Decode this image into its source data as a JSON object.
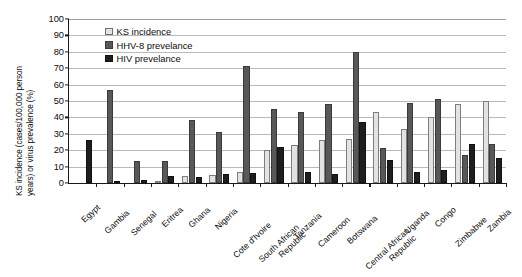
{
  "chart_data": {
    "type": "bar",
    "title": "",
    "xlabel": "",
    "ylabel_line1": "KS incidence (cases/100,000 person",
    "ylabel_line2": "years) or virus prevalence (%)",
    "ylim": [
      0,
      100
    ],
    "yticks": [
      0,
      10,
      20,
      30,
      40,
      50,
      60,
      70,
      80,
      90,
      100
    ],
    "grid": true,
    "legend_position": "top-left-inside",
    "categories": [
      "Egypt",
      "Gambia",
      "Senegal",
      "Eritrea",
      "Ghana",
      "Nigeria",
      "Cote d'Ivoire",
      "South African Republic",
      "Tanzania",
      "Cameroon",
      "Botswana",
      "Central African Republic",
      "Uganda",
      "Congo",
      "Zimbabwe",
      "Zambia"
    ],
    "category_lines": [
      [
        "Egypt"
      ],
      [
        "Gambia"
      ],
      [
        "Senegal"
      ],
      [
        "Eritrea"
      ],
      [
        "Ghana"
      ],
      [
        "Nigeria"
      ],
      [
        "Cote d'Ivoire"
      ],
      [
        "South African",
        "Republic"
      ],
      [
        "Tanzania"
      ],
      [
        "Cameroon"
      ],
      [
        "Botswana"
      ],
      [
        "Central African",
        "Republic"
      ],
      [
        "Uganda"
      ],
      [
        "Congo"
      ],
      [
        "Zimbabwe"
      ],
      [
        "Zambia"
      ]
    ],
    "series": [
      {
        "name": "KS incidence",
        "key": "ks",
        "color": "#e3e3e3",
        "values": [
          null,
          null,
          null,
          1.5,
          4.5,
          5,
          7,
          20,
          23,
          26,
          27,
          43,
          33,
          40,
          48,
          50
        ]
      },
      {
        "name": "HHV-8 prevelance",
        "key": "hhv",
        "color": "#585858",
        "values": [
          null,
          57,
          13.5,
          13.5,
          38.5,
          31,
          71.5,
          45,
          43,
          48,
          80,
          21.5,
          49,
          51,
          17,
          23.5
        ]
      },
      {
        "name": "HIV prevelance",
        "key": "hiv",
        "color": "#1e1e1e",
        "values": [
          26,
          1,
          2,
          4,
          3.5,
          5.5,
          6,
          22,
          7,
          5.5,
          37,
          14,
          6.5,
          8,
          24,
          15
        ]
      }
    ]
  },
  "legend": {
    "items": [
      {
        "label": "KS incidence",
        "key": "ks"
      },
      {
        "label": "HHV-8 prevelance",
        "key": "hhv"
      },
      {
        "label": "HIV prevelance",
        "key": "hiv"
      }
    ]
  }
}
